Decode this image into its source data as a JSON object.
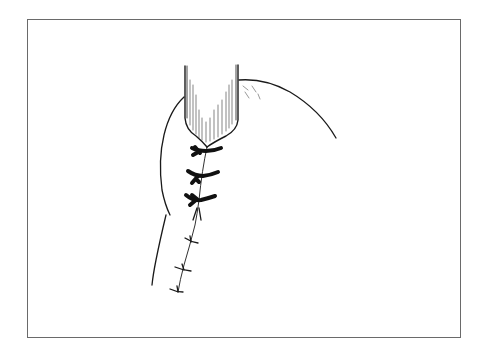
{
  "figure": {
    "type": "line-illustration",
    "colors": {
      "ink": "#1a1a1a",
      "frame": "#6a6a6a",
      "background": "#ffffff"
    },
    "sutures": {
      "heavy_interrupted_count": 3,
      "fine_interrupted_count": 3
    }
  }
}
